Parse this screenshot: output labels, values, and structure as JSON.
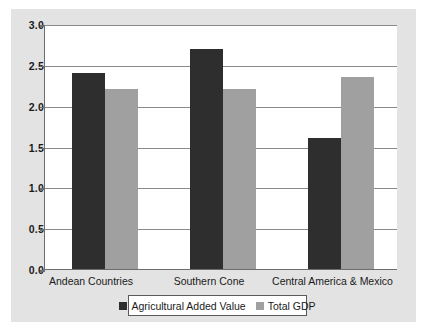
{
  "chart_data": {
    "type": "bar",
    "title": "",
    "xlabel": "",
    "ylabel": "",
    "ylim": [
      0.0,
      3.0
    ],
    "ytick_labels": [
      "0.0",
      "0.5",
      "1.0",
      "1.5",
      "2.0",
      "2.5",
      "3.0"
    ],
    "ytick_values": [
      0.0,
      0.5,
      1.0,
      1.5,
      2.0,
      2.5,
      3.0
    ],
    "grid": true,
    "legend_position": "bottom",
    "categories": [
      "Andean Countries",
      "Southern Cone",
      "Central America & Mexico"
    ],
    "series": [
      {
        "name": "Agricultural Added Value",
        "color": "#2e2e2e",
        "values": [
          2.4,
          2.7,
          1.6
        ]
      },
      {
        "name": "Total GDP",
        "color": "#a0a0a0",
        "values": [
          2.2,
          2.2,
          2.35
        ]
      }
    ]
  },
  "panel": {
    "background_color": "#e3e3e3",
    "plot_background_color": "#ffffff",
    "axis_color": "#6d6d6d",
    "gridline_color": "#8a8a8a"
  }
}
